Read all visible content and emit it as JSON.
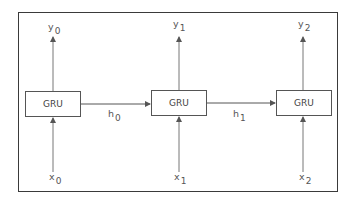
{
  "diagram": {
    "type": "unrolled-recurrent-network",
    "cells": [
      {
        "label": "GRU",
        "input": "x",
        "input_index": "0",
        "output": "y",
        "output_index": "0"
      },
      {
        "label": "GRU",
        "input": "x",
        "input_index": "1",
        "output": "y",
        "output_index": "1"
      },
      {
        "label": "GRU",
        "input": "x",
        "input_index": "2",
        "output": "y",
        "output_index": "2"
      }
    ],
    "hidden_states": [
      {
        "name": "h",
        "index": "0"
      },
      {
        "name": "h",
        "index": "1"
      }
    ],
    "colors": {
      "line": "#555555",
      "frame": "#3a3a3a",
      "text": "#555555"
    }
  }
}
